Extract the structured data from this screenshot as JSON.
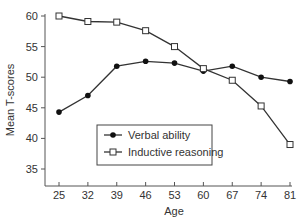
{
  "chart_data": {
    "type": "line",
    "title": "",
    "xlabel": "Age",
    "ylabel": "Mean T-scores",
    "x": [
      25,
      32,
      39,
      46,
      53,
      60,
      67,
      74,
      81
    ],
    "x_ticks": [
      "25",
      "32",
      "39",
      "46",
      "53",
      "60",
      "67",
      "74",
      "81"
    ],
    "y_ticks": [
      "35",
      "40",
      "45",
      "50",
      "55",
      "60"
    ],
    "ylim": [
      32.3,
      60
    ],
    "grid": false,
    "legend_position": "lower-center",
    "series": [
      {
        "name": "Verbal ability",
        "marker": "filled-circle",
        "values": [
          44.3,
          47.0,
          51.8,
          52.6,
          52.3,
          51.0,
          51.8,
          50.0,
          49.3
        ]
      },
      {
        "name": "Inductive reasoning",
        "marker": "open-square",
        "values": [
          60.0,
          59.1,
          59.0,
          57.6,
          55.0,
          51.4,
          49.5,
          45.3,
          39.0
        ]
      }
    ]
  }
}
